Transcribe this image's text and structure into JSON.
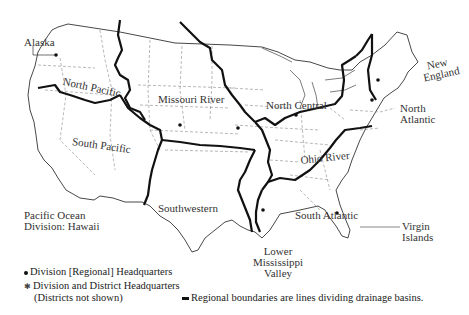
{
  "map": {
    "title": "U.S. Army Corps of Engineers Divisions",
    "regions": [
      {
        "id": "north-pacific",
        "label": "North Pacific"
      },
      {
        "id": "south-pacific",
        "label": "South Pacific"
      },
      {
        "id": "missouri-river",
        "label": "Missouri River"
      },
      {
        "id": "north-central",
        "label": "North Central"
      },
      {
        "id": "ohio-river",
        "label": "Ohio River"
      },
      {
        "id": "southwestern",
        "label": "Southwestern"
      },
      {
        "id": "lower-mississippi-valley",
        "label_lines": [
          "Lower",
          "Mississippi",
          "Valley"
        ]
      },
      {
        "id": "south-atlantic",
        "label": "South Atlantic"
      },
      {
        "id": "north-atlantic",
        "label_lines": [
          "North",
          "Atlantic"
        ]
      },
      {
        "id": "new-england",
        "label_lines": [
          "New",
          "England"
        ]
      }
    ],
    "callouts": {
      "alaska": "Alaska",
      "pacific_ocean": [
        "Pacific Ocean",
        "Division: Hawaii"
      ],
      "virgin_islands": [
        "Virgin",
        "Islands"
      ]
    }
  },
  "legend": {
    "division_hq": "Division [Regional] Headquarters",
    "division_district_hq": "Division and District Headquarters",
    "division_district_hq_note": "(Districts not shown)",
    "boundaries": "Regional boundaries are lines dividing drainage basins."
  },
  "colors": {
    "boundary": "#111111",
    "state_lines": "#888888",
    "coast": "#333333",
    "text": "#333333"
  }
}
